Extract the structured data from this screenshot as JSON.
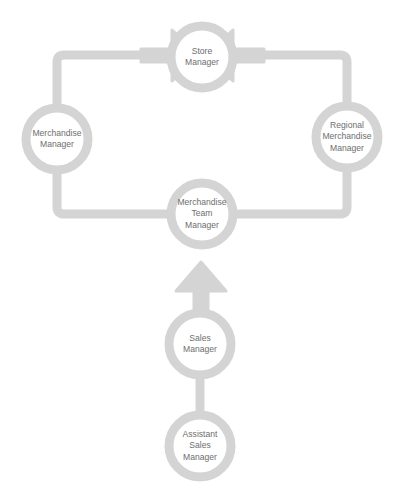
{
  "diagram": {
    "stroke_color": "#d4d4d4",
    "arrow_color": "#d4d4d4",
    "text_color": "#6e6e6e",
    "background_color": "#ffffff",
    "node_fill": "#ffffff",
    "stroke_width": 9,
    "nodes": [
      {
        "id": "store-manager",
        "lines": [
          "Store",
          "Manager"
        ],
        "cx": 202,
        "cy": 57,
        "r": 31
      },
      {
        "id": "merchandise-manager",
        "lines": [
          "Merchandise",
          "Manager"
        ],
        "cx": 57,
        "cy": 139,
        "r": 31
      },
      {
        "id": "regional-merchandise-manager",
        "lines": [
          "Regional",
          "Merchandise",
          "Manager"
        ],
        "cx": 347,
        "cy": 137,
        "r": 31
      },
      {
        "id": "merchandise-team-manager",
        "lines": [
          "Merchandise",
          "Team",
          "Manager"
        ],
        "cx": 202,
        "cy": 214,
        "r": 31
      },
      {
        "id": "sales-manager",
        "lines": [
          "Sales",
          "Manager"
        ],
        "cx": 200,
        "cy": 344,
        "r": 31
      },
      {
        "id": "assistant-sales-manager",
        "lines": [
          "Assistant",
          "Sales",
          "Manager"
        ],
        "cx": 200,
        "cy": 446,
        "r": 31
      }
    ],
    "connectors": [
      {
        "id": "merchandise-manager-to-store-manager",
        "from": "merchandise-manager",
        "to": "store-manager",
        "arrowhead": "end",
        "arrow_direction": "right"
      },
      {
        "id": "regional-merchandise-manager-to-store-manager",
        "from": "regional-merchandise-manager",
        "to": "store-manager",
        "arrowhead": "end",
        "arrow_direction": "left"
      },
      {
        "id": "merchandise-manager-to-team-manager",
        "from": "merchandise-manager",
        "to": "merchandise-team-manager",
        "arrowhead": "none"
      },
      {
        "id": "regional-merchandise-manager-to-team-manager",
        "from": "regional-merchandise-manager",
        "to": "merchandise-team-manager",
        "arrowhead": "none"
      },
      {
        "id": "sales-manager-to-team-manager",
        "from": "sales-manager",
        "to": "merchandise-team-manager",
        "arrowhead": "end",
        "arrow_direction": "up"
      },
      {
        "id": "assistant-sales-manager-to-sales-manager",
        "from": "assistant-sales-manager",
        "to": "sales-manager",
        "arrowhead": "none"
      }
    ]
  }
}
